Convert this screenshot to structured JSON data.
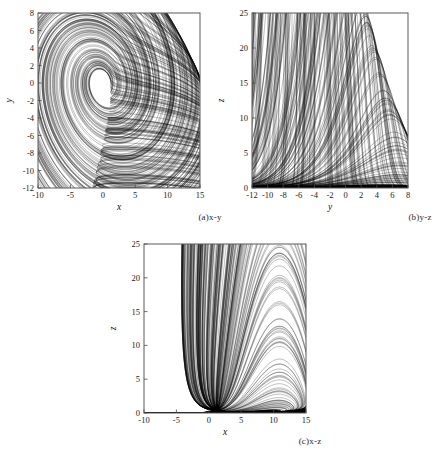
{
  "figure": {
    "caption_a": "(a)x-y",
    "caption_b": "(b)y-z",
    "caption_c": "(c)x-z"
  },
  "chart_data": [
    {
      "id": "panel-a",
      "type": "line",
      "title": "(a)x-y",
      "xlabel": "x",
      "ylabel": "y",
      "xlim": [
        -10,
        15
      ],
      "ylim": [
        -12,
        8
      ],
      "xticks": [
        -10,
        -5,
        0,
        5,
        10,
        15
      ],
      "yticks": [
        -12,
        -10,
        -8,
        -6,
        -4,
        -2,
        0,
        2,
        4,
        6,
        8
      ],
      "xticklabels": [
        "-10",
        "-5",
        "0",
        "5",
        "10",
        "15"
      ],
      "yticklabels": [
        "-12",
        "-10",
        "-8",
        "-6",
        "-4",
        "-2",
        "0",
        "2",
        "4",
        "6",
        "8"
      ],
      "grid": false,
      "legend": "none",
      "projection": [
        "x",
        "y"
      ],
      "description": "Chaotic attractor projection onto the x-y plane: dense nested spiral orbits winding outward from a small inner core near (-1, 0) to an outer boundary reaching about x = 11, y = -11."
    },
    {
      "id": "panel-b",
      "type": "line",
      "title": "(b)y-z",
      "xlabel": "y",
      "ylabel": "z",
      "xlim": [
        -12,
        8
      ],
      "ylim": [
        0,
        25
      ],
      "xticks": [
        -12,
        -10,
        -8,
        -6,
        -4,
        -2,
        0,
        2,
        4,
        6,
        8
      ],
      "yticks": [
        0,
        5,
        10,
        15,
        20,
        25
      ],
      "xticklabels": [
        "-12",
        "-10",
        "-8",
        "-6",
        "-4",
        "-2",
        "0",
        "2",
        "4",
        "6",
        "8"
      ],
      "yticklabels": [
        "0",
        "5",
        "10",
        "15",
        "20",
        "25"
      ],
      "grid": false,
      "legend": "none",
      "projection": [
        "y",
        "z"
      ],
      "description": "Chaotic attractor projection onto the y-z plane: a sharply skewed family of peaks rising from near z = 0 to a maximum of about z = 23 at y = 1, with steep right-hand descent and fine filamentary structure between y = 2 and y = 5."
    },
    {
      "id": "panel-c",
      "type": "line",
      "title": "(c)x-z",
      "xlabel": "x",
      "ylabel": "z",
      "xlim": [
        -10,
        15
      ],
      "ylim": [
        0,
        25
      ],
      "xticks": [
        -10,
        -5,
        0,
        5,
        10,
        15
      ],
      "yticks": [
        0,
        5,
        10,
        15,
        20,
        25
      ],
      "xticklabels": [
        "-10",
        "-5",
        "0",
        "5",
        "10",
        "15"
      ],
      "yticklabels": [
        "0",
        "5",
        "10",
        "15",
        "20",
        "25"
      ],
      "grid": false,
      "legend": "none",
      "projection": [
        "x",
        "z"
      ],
      "description": "Chaotic attractor projection onto the x-z plane: nested arches spanning x from about -3 to 11, peaking near z = 23 at x = 5, with a dense low band near z = 0."
    }
  ]
}
